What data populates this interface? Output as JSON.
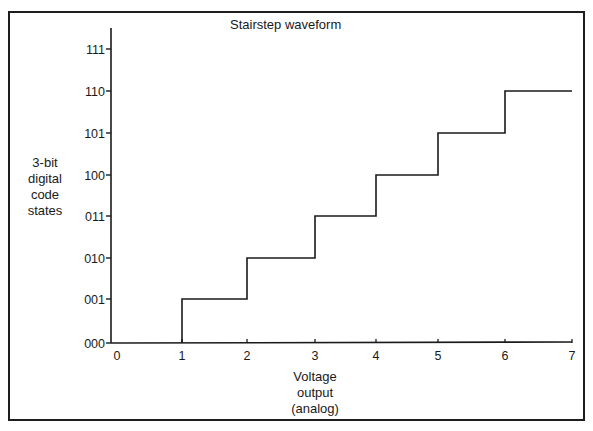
{
  "chart_data": {
    "type": "line",
    "subtype": "step",
    "title": "Stairstep waveform",
    "xlabel": "Voltage output (analog)",
    "xlabel_lines": [
      "Voltage",
      "output",
      "(analog)"
    ],
    "ylabel": "3-bit digital code states",
    "ylabel_lines": [
      "3-bit",
      "digital",
      "code",
      "states"
    ],
    "x_ticks": [
      "0",
      "1",
      "2",
      "3",
      "4",
      "5",
      "6",
      "7"
    ],
    "y_ticks": [
      "000",
      "001",
      "010",
      "011",
      "100",
      "101",
      "110",
      "111"
    ],
    "xlim": [
      0,
      7
    ],
    "ylim": [
      0,
      7
    ],
    "grid": false,
    "legend": null,
    "series": [
      {
        "name": "Stairstep waveform",
        "step_points": [
          {
            "x": 1,
            "y": 0,
            "code": "000"
          },
          {
            "x": 1,
            "y": 1,
            "code": "001"
          },
          {
            "x": 2,
            "y": 1,
            "code": "001"
          },
          {
            "x": 2,
            "y": 2,
            "code": "010"
          },
          {
            "x": 3,
            "y": 2,
            "code": "010"
          },
          {
            "x": 3,
            "y": 3,
            "code": "011"
          },
          {
            "x": 4,
            "y": 3,
            "code": "011"
          },
          {
            "x": 4,
            "y": 4,
            "code": "100"
          },
          {
            "x": 5,
            "y": 4,
            "code": "100"
          },
          {
            "x": 5,
            "y": 5,
            "code": "101"
          },
          {
            "x": 6,
            "y": 5,
            "code": "101"
          },
          {
            "x": 6,
            "y": 6,
            "code": "110"
          },
          {
            "x": 7,
            "y": 6,
            "code": "110"
          }
        ],
        "levels": [
          {
            "from_x": 1,
            "to_x": 2,
            "code": "001"
          },
          {
            "from_x": 2,
            "to_x": 3,
            "code": "010"
          },
          {
            "from_x": 3,
            "to_x": 4,
            "code": "011"
          },
          {
            "from_x": 4,
            "to_x": 5,
            "code": "100"
          },
          {
            "from_x": 5,
            "to_x": 6,
            "code": "101"
          },
          {
            "from_x": 6,
            "to_x": 7,
            "code": "110"
          }
        ]
      }
    ]
  },
  "colors": {
    "line": "#1a1a1a",
    "axis": "#1a1a1a",
    "background": "#ffffff"
  },
  "layout": {
    "x_pixels": [
      111,
      182,
      247,
      315,
      376,
      438,
      505,
      572
    ],
    "y_pixels": [
      343,
      299,
      258,
      216,
      175,
      133,
      91,
      49
    ]
  }
}
